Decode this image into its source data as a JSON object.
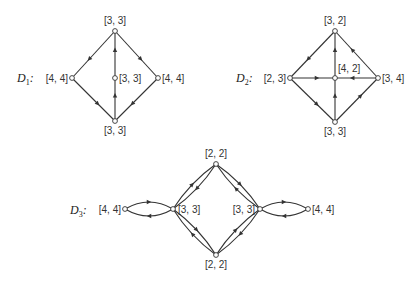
{
  "diagrams": [
    {
      "name": "D1",
      "label": "D",
      "subscript": "1",
      "label_pos": [
        17,
        82
      ],
      "nodes": [
        {
          "id": "top",
          "x": 115,
          "y": 31,
          "label": "[3, 3]",
          "lx": 115,
          "ly": 24,
          "anchor": "middle"
        },
        {
          "id": "left",
          "x": 72,
          "y": 78,
          "label": "[4, 4]",
          "lx": 68,
          "ly": 82,
          "anchor": "end"
        },
        {
          "id": "center",
          "x": 115,
          "y": 78,
          "label": "[3, 3]",
          "lx": 119,
          "ly": 82,
          "anchor": "start"
        },
        {
          "id": "right",
          "x": 158,
          "y": 78,
          "label": "[4, 4]",
          "lx": 162,
          "ly": 82,
          "anchor": "start"
        },
        {
          "id": "bottom",
          "x": 115,
          "y": 121,
          "label": "[3, 3]",
          "lx": 115,
          "ly": 134,
          "anchor": "middle"
        }
      ],
      "edges": [
        {
          "from": "top",
          "to": "left"
        },
        {
          "from": "top",
          "to": "right"
        },
        {
          "from": "left",
          "to": "bottom"
        },
        {
          "from": "right",
          "to": "bottom"
        },
        {
          "from": "center",
          "to": "top"
        },
        {
          "from": "bottom",
          "to": "center"
        }
      ]
    },
    {
      "name": "D2",
      "label": "D",
      "subscript": "2",
      "label_pos": [
        236,
        82
      ],
      "nodes": [
        {
          "id": "top",
          "x": 335,
          "y": 31,
          "label": "[3, 2]",
          "lx": 335,
          "ly": 24,
          "anchor": "middle"
        },
        {
          "id": "left",
          "x": 290,
          "y": 78,
          "label": "[2, 3]",
          "lx": 286,
          "ly": 82,
          "anchor": "end"
        },
        {
          "id": "center",
          "x": 335,
          "y": 78,
          "label": "[4, 2]",
          "lx": 338,
          "ly": 72,
          "anchor": "start"
        },
        {
          "id": "right",
          "x": 378,
          "y": 78,
          "label": "[3, 4]",
          "lx": 382,
          "ly": 82,
          "anchor": "start"
        },
        {
          "id": "bottom",
          "x": 335,
          "y": 122,
          "label": "[3, 3]",
          "lx": 335,
          "ly": 135,
          "anchor": "middle"
        }
      ],
      "edges": [
        {
          "from": "top",
          "to": "left"
        },
        {
          "from": "right",
          "to": "top"
        },
        {
          "from": "left",
          "to": "center"
        },
        {
          "from": "right",
          "to": "center"
        },
        {
          "from": "center",
          "to": "top"
        },
        {
          "from": "bottom",
          "to": "center"
        },
        {
          "from": "left",
          "to": "bottom"
        },
        {
          "from": "bottom",
          "to": "right"
        }
      ]
    },
    {
      "name": "D3",
      "label": "D",
      "subscript": "3",
      "label_pos": [
        70,
        214
      ],
      "nodes": [
        {
          "id": "top",
          "x": 216,
          "y": 164,
          "label": "[2, 2]",
          "lx": 216,
          "ly": 157,
          "anchor": "middle"
        },
        {
          "id": "lout",
          "x": 125,
          "y": 209,
          "label": "[4, 4]",
          "lx": 121,
          "ly": 213,
          "anchor": "end"
        },
        {
          "id": "lin",
          "x": 173,
          "y": 209,
          "label": "[3, 3]",
          "lx": 178,
          "ly": 213,
          "anchor": "start"
        },
        {
          "id": "rin",
          "x": 260,
          "y": 209,
          "label": "[3, 3]",
          "lx": 255,
          "ly": 213,
          "anchor": "end"
        },
        {
          "id": "rout",
          "x": 308,
          "y": 209,
          "label": "[4, 4]",
          "lx": 312,
          "ly": 213,
          "anchor": "start"
        },
        {
          "id": "bottom",
          "x": 216,
          "y": 255,
          "label": "[2, 2]",
          "lx": 216,
          "ly": 268,
          "anchor": "middle"
        }
      ],
      "edges": [
        {
          "from": "lin",
          "to": "lout",
          "bend": -7
        },
        {
          "from": "lout",
          "to": "lin",
          "bend": -7
        },
        {
          "from": "rin",
          "to": "rout",
          "bend": -7
        },
        {
          "from": "rout",
          "to": "rin",
          "bend": -7
        },
        {
          "from": "top",
          "to": "lin",
          "bend": -3
        },
        {
          "from": "lin",
          "to": "top",
          "bend": -3
        },
        {
          "from": "rin",
          "to": "top",
          "bend": -3
        },
        {
          "from": "top",
          "to": "rin",
          "bend": -3
        },
        {
          "from": "lin",
          "to": "bottom",
          "bend": -3
        },
        {
          "from": "bottom",
          "to": "lin",
          "bend": -3
        },
        {
          "from": "bottom",
          "to": "rin",
          "bend": -3
        },
        {
          "from": "rin",
          "to": "bottom",
          "bend": -3
        }
      ]
    }
  ]
}
